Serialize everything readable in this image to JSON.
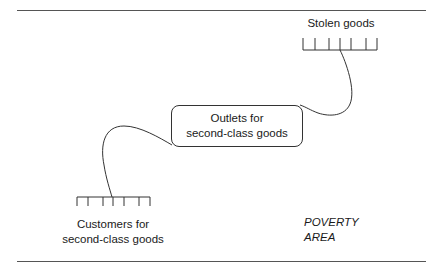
{
  "diagram": {
    "nodes": {
      "stolen_goods": {
        "label": "Stolen goods"
      },
      "outlets": {
        "line1": "Outlets for",
        "line2": "second-class goods"
      },
      "customers": {
        "line1": "Customers for",
        "line2": "second-class goods"
      }
    },
    "area_label": {
      "line1": "POVERTY",
      "line2": "AREA"
    },
    "colors": {
      "stroke": "#333333",
      "rule": "#555555",
      "text": "#1a1a1a"
    },
    "edges": [
      {
        "from": "stolen_goods",
        "to": "outlets"
      },
      {
        "from": "outlets",
        "to": "customers"
      }
    ]
  }
}
